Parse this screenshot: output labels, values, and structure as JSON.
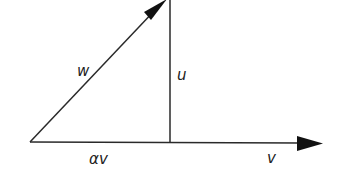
{
  "diagram": {
    "type": "vector-decomposition",
    "vectors": [
      {
        "name": "w",
        "label": "w",
        "from": [
          30,
          142
        ],
        "to": [
          166,
          0
        ],
        "arrow": true
      },
      {
        "name": "v",
        "label": "v",
        "from": [
          30,
          142
        ],
        "to": [
          322,
          143
        ],
        "arrow": true
      },
      {
        "name": "u",
        "label": "u",
        "from": [
          170,
          142
        ],
        "to": [
          170,
          0
        ],
        "arrow": false
      }
    ],
    "labels": {
      "w": "w",
      "u": "u",
      "alpha_v": "αv",
      "v": "v"
    },
    "colors": {
      "line": "#2a2a2a",
      "arrowhead": "#111111",
      "background": "#ffffff"
    }
  }
}
